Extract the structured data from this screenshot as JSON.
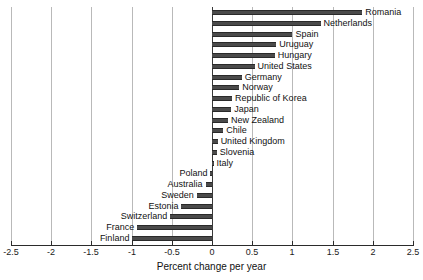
{
  "chart_data": {
    "type": "bar",
    "orientation": "horizontal",
    "title": "",
    "subtitle": "",
    "xlabel": "Percent change per year",
    "ylabel": "",
    "xlim": [
      -2.5,
      2.5
    ],
    "xticks": [
      -2.5,
      -2,
      -1.5,
      -1,
      -0.5,
      0,
      0.5,
      1,
      1.5,
      2,
      2.5
    ],
    "xtick_labels": [
      "-2.5",
      "-2",
      "-1.5",
      "-1",
      "-0.5",
      "0",
      "0.5",
      "1",
      "1.5",
      "2",
      "2.5"
    ],
    "grid": true,
    "grid_axis": "x",
    "legend": null,
    "bar_color": "#4a4a4a",
    "categories": [
      "Romania",
      "Netherlands",
      "Spain",
      "Uruguay",
      "Hungary",
      "United States",
      "Germany",
      "Norway",
      "Republic of Korea",
      "Japan",
      "New Zealand",
      "Chile",
      "United Kingdom",
      "Slovenia",
      "Italy",
      "Poland",
      "Australia",
      "Sweden",
      "Estonia",
      "Switzerland",
      "France",
      "Finland"
    ],
    "values": [
      1.87,
      1.35,
      1.0,
      0.8,
      0.78,
      0.53,
      0.37,
      0.34,
      0.25,
      0.24,
      0.2,
      0.14,
      0.07,
      0.06,
      0.02,
      -0.02,
      -0.08,
      -0.19,
      -0.38,
      -0.52,
      -0.93,
      -0.99
    ]
  },
  "axis": {
    "xlabel": "Percent change per year"
  }
}
